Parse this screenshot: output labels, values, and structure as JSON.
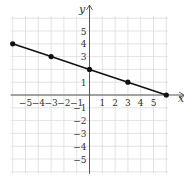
{
  "chart_data": {
    "type": "line",
    "title": "",
    "xlabel": "x",
    "ylabel": "y",
    "xlim": [
      -6,
      6
    ],
    "ylim": [
      -6,
      6
    ],
    "grid": true,
    "x_ticks": [
      "-5",
      "-4",
      "-3",
      "-2",
      "-1",
      "1",
      "2",
      "3",
      "4",
      "5"
    ],
    "y_ticks": [
      "5",
      "4",
      "3",
      "1",
      "-1",
      "-2",
      "-3",
      "-4",
      "-5"
    ],
    "series": [
      {
        "name": "line",
        "equation": "y = -x/3 + 2",
        "points": [
          [
            -6,
            4
          ],
          [
            -3,
            3
          ],
          [
            0,
            2
          ],
          [
            3,
            1
          ],
          [
            6,
            0
          ]
        ]
      }
    ],
    "colors": {
      "line": "#111111",
      "grid": "#dcdcdc",
      "axis": "#555555"
    }
  }
}
